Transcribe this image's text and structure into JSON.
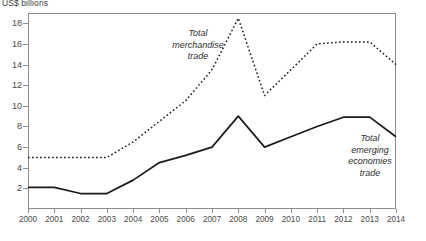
{
  "axis_unit_label": "US$ billions",
  "annotations": {
    "merchandise": [
      "Total",
      "merchandise",
      "trade"
    ],
    "emerging": [
      "Total",
      "emerging",
      "economies",
      "trade"
    ]
  },
  "colors": {
    "line": "#1a1a1a",
    "axis": "#8b8b8b",
    "text": "#4a4a4a"
  },
  "chart_data": {
    "type": "line",
    "title": "",
    "xlabel": "",
    "ylabel": "US$ billions",
    "ylim": [
      0,
      19
    ],
    "xlim": [
      2000,
      2014
    ],
    "grid": false,
    "legend": "annotations-inline",
    "yticks": [
      2,
      4,
      6,
      8,
      10,
      12,
      14,
      16,
      18
    ],
    "categories": [
      "2000",
      "2001",
      "2002",
      "2003",
      "2004",
      "2005",
      "2006",
      "2007",
      "2008",
      "2009",
      "2010",
      "2011",
      "2012",
      "2013",
      "2014"
    ],
    "x": [
      2000,
      2001,
      2002,
      2003,
      2004,
      2005,
      2006,
      2007,
      2008,
      2009,
      2010,
      2011,
      2012,
      2013,
      2014
    ],
    "series": [
      {
        "name": "Total merchandise trade",
        "style": "dotted",
        "values": [
          5.0,
          5.0,
          5.0,
          5.0,
          6.5,
          8.5,
          10.5,
          13.5,
          18.5,
          11.0,
          13.5,
          16.0,
          16.2,
          16.2,
          14.0
        ]
      },
      {
        "name": "Total emerging economies trade",
        "style": "solid",
        "values": [
          2.1,
          2.1,
          1.5,
          1.5,
          2.8,
          4.5,
          5.2,
          6.0,
          9.0,
          6.0,
          7.0,
          8.0,
          8.9,
          8.9,
          7.0
        ]
      }
    ]
  }
}
